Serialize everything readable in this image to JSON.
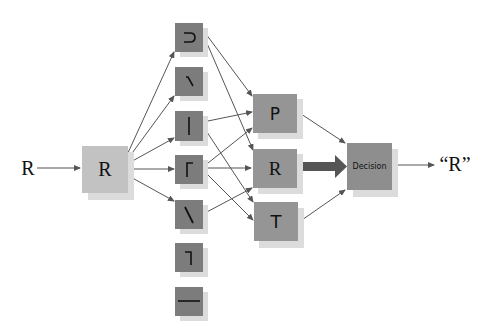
{
  "diagram": {
    "input_label": "R",
    "input_box": {
      "label": "R"
    },
    "feature_detectors": [
      {
        "name": "curve",
        "glyph": "⊃"
      },
      {
        "name": "diagonal-forward",
        "glyph": "/"
      },
      {
        "name": "vertical",
        "glyph": "|"
      },
      {
        "name": "corner-top-left",
        "glyph": "Γ"
      },
      {
        "name": "diagonal-back",
        "glyph": "\\"
      },
      {
        "name": "corner-top-right",
        "glyph": "¬"
      },
      {
        "name": "horizontal",
        "glyph": "—"
      }
    ],
    "letter_detectors": [
      {
        "label": "P"
      },
      {
        "label": "R"
      },
      {
        "label": "T"
      }
    ],
    "decision_box": {
      "label": "Decision"
    },
    "output_label": "“R”",
    "colors": {
      "input_box": "#c2c2c2",
      "feature_box": "#7c7c7c",
      "letter_box": "#959595",
      "decision_box": "#8e8e8e",
      "shadow": "#dcdcdc",
      "arrow": "#555555",
      "strong_arrow": "#555555"
    }
  }
}
